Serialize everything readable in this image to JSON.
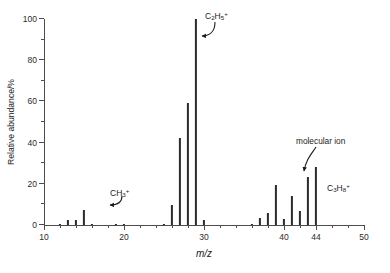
{
  "chart_data": {
    "type": "bar",
    "title": "",
    "subtitle": "",
    "xlabel": "m/z",
    "ylabel": "Relative abundance/%",
    "xlim": [
      10,
      50
    ],
    "ylim": [
      0,
      100
    ],
    "grid": false,
    "legend": null,
    "x_ticks_major": [
      10,
      20,
      30,
      40,
      44,
      50
    ],
    "x_ticks_minor": [
      12,
      14,
      16,
      18,
      22,
      24,
      26,
      28,
      32,
      34,
      36,
      38,
      42,
      46,
      48
    ],
    "y_ticks_major": [
      0,
      20,
      40,
      60,
      80,
      100
    ],
    "y_ticks_minor": [
      10,
      30,
      50,
      70,
      90
    ],
    "x": [
      12,
      13,
      14,
      15,
      16,
      19,
      20,
      25,
      26,
      27,
      28,
      29,
      30,
      36,
      37,
      38,
      39,
      40,
      41,
      42,
      43,
      44
    ],
    "values": [
      0.6,
      2.2,
      2.6,
      7.2,
      0.6,
      0.6,
      0.6,
      0.7,
      9.5,
      42,
      59,
      100,
      2.5,
      0.7,
      3.2,
      6.0,
      19.2,
      3.0,
      14.0,
      6.8,
      23.5,
      28.0
    ],
    "annotations": [
      {
        "name": "methyl-cation",
        "text": "CH3+",
        "target_x": 15,
        "target_y": 7.2
      },
      {
        "name": "ethyl-cation",
        "text": "C2H5+",
        "target_x": 29,
        "target_y": 100
      },
      {
        "name": "propane-molecular-ion",
        "text": "C3H8+",
        "target_x": 44,
        "target_y": 28
      },
      {
        "name": "molecular-ion-callout",
        "text": "molecular ion",
        "target_x": 44,
        "target_y": 28
      }
    ]
  },
  "axes": {
    "y_title": "Relative abundance/%",
    "x_title": "m/z",
    "y_tick_labels": [
      "0",
      "20",
      "40",
      "60",
      "80",
      "100"
    ],
    "x_tick_labels": [
      "10",
      "20",
      "30",
      "40",
      "44",
      "50"
    ]
  },
  "labels": {
    "ch3_formula": "CH",
    "ch3_sub": "3",
    "ch3_sup": "+",
    "c2h5_c": "C",
    "c2h5_sub1": "2",
    "c2h5_h": "H",
    "c2h5_sub2": "5",
    "c2h5_sup": "+",
    "c3h8_c": "C",
    "c3h8_sub1": "3",
    "c3h8_h": "H",
    "c3h8_sub2": "8",
    "c3h8_sup": "+",
    "molecular_ion": "molecular ion"
  },
  "style": {
    "peak_color": "#2a2a2a",
    "axis_color": "#4d4d4d",
    "text_color": "#1a1a1a",
    "background": "#ffffff"
  }
}
